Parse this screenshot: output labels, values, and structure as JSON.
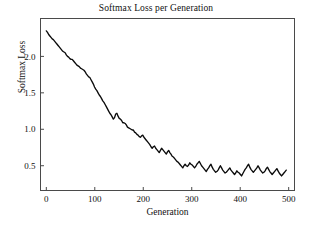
{
  "chart_data": {
    "type": "line",
    "title": "Softmax Loss per Generation",
    "xlabel": "Generation",
    "ylabel": "Softmax Loss",
    "xlim": [
      -12,
      512
    ],
    "ylim": [
      0.16,
      2.52
    ],
    "xticks": [
      0,
      100,
      200,
      300,
      400,
      500
    ],
    "xticklabels": [
      "0",
      "100",
      "200",
      "300",
      "400",
      "500"
    ],
    "yticks": [
      0.5,
      1.0,
      1.5,
      2.0
    ],
    "yticklabels": [
      "0.5",
      "1.0",
      "1.5",
      "2.0"
    ],
    "grid": false,
    "legend": null,
    "line_color": "#0b0b0b",
    "series": [
      {
        "name": "Softmax Loss",
        "x": [
          0,
          5,
          10,
          15,
          20,
          25,
          30,
          35,
          40,
          45,
          50,
          55,
          60,
          65,
          70,
          75,
          80,
          85,
          90,
          95,
          100,
          105,
          110,
          115,
          120,
          125,
          130,
          135,
          140,
          145,
          150,
          155,
          160,
          165,
          170,
          175,
          180,
          185,
          190,
          195,
          200,
          205,
          210,
          215,
          220,
          225,
          230,
          235,
          240,
          245,
          250,
          255,
          260,
          265,
          270,
          275,
          280,
          285,
          290,
          295,
          300,
          305,
          310,
          315,
          320,
          325,
          330,
          335,
          340,
          345,
          350,
          355,
          360,
          365,
          370,
          375,
          380,
          385,
          390,
          395,
          400,
          405,
          410,
          415,
          420,
          425,
          430,
          435,
          440,
          445,
          450,
          455,
          460,
          465,
          470,
          475,
          480,
          485,
          490,
          495
        ],
        "y": [
          2.35,
          2.3,
          2.24,
          2.21,
          2.17,
          2.12,
          2.08,
          2.06,
          2.0,
          1.97,
          1.96,
          1.9,
          1.86,
          1.83,
          1.81,
          1.74,
          1.71,
          1.64,
          1.58,
          1.53,
          1.47,
          1.41,
          1.37,
          1.31,
          1.25,
          1.2,
          1.14,
          1.17,
          1.22,
          1.14,
          1.09,
          1.08,
          1.03,
          1.0,
          0.99,
          0.95,
          0.92,
          0.89,
          0.92,
          0.87,
          0.83,
          0.79,
          0.74,
          0.77,
          0.72,
          0.68,
          0.74,
          0.7,
          0.66,
          0.71,
          0.66,
          0.62,
          0.58,
          0.55,
          0.51,
          0.47,
          0.52,
          0.49,
          0.54,
          0.51,
          0.47,
          0.52,
          0.56,
          0.5,
          0.46,
          0.42,
          0.47,
          0.52,
          0.45,
          0.41,
          0.44,
          0.5,
          0.44,
          0.4,
          0.43,
          0.47,
          0.42,
          0.38,
          0.43,
          0.4,
          0.36,
          0.42,
          0.47,
          0.52,
          0.45,
          0.41,
          0.45,
          0.5,
          0.44,
          0.4,
          0.43,
          0.48,
          0.42,
          0.38,
          0.42,
          0.46,
          0.4,
          0.36,
          0.4,
          0.44
        ],
        "y_detail": [
          2.35,
          2.33,
          2.3,
          2.28,
          2.26,
          2.24,
          2.23,
          2.21,
          2.19,
          2.17,
          2.15,
          2.13,
          2.11,
          2.09,
          2.07,
          2.06,
          2.05,
          2.02,
          2.0,
          1.99,
          1.97,
          1.96,
          1.96,
          1.94,
          1.92,
          1.9,
          1.88,
          1.87,
          1.86,
          1.84,
          1.83,
          1.82,
          1.81,
          1.79,
          1.76,
          1.74,
          1.72,
          1.71,
          1.68,
          1.65,
          1.62,
          1.58,
          1.55,
          1.53,
          1.5,
          1.47,
          1.45,
          1.42,
          1.39,
          1.37,
          1.34,
          1.31,
          1.28,
          1.25,
          1.22,
          1.2,
          1.17,
          1.14,
          1.16,
          1.21,
          1.22,
          1.18,
          1.15,
          1.14,
          1.12,
          1.09,
          1.09,
          1.08,
          1.06,
          1.03,
          1.02,
          1.01,
          1.0,
          0.99,
          0.99,
          0.96,
          0.95,
          0.93,
          0.92,
          0.9,
          0.89,
          0.91,
          0.92,
          0.89,
          0.87,
          0.85,
          0.83,
          0.81,
          0.79,
          0.76,
          0.74,
          0.76,
          0.77,
          0.74,
          0.72,
          0.7,
          0.68,
          0.71,
          0.74,
          0.72,
          0.7,
          0.68,
          0.66,
          0.69,
          0.71,
          0.68,
          0.66,
          0.63,
          0.62,
          0.6,
          0.58,
          0.56,
          0.55,
          0.53,
          0.51,
          0.49,
          0.47,
          0.5,
          0.52,
          0.5,
          0.49,
          0.51,
          0.54,
          0.52,
          0.51,
          0.49,
          0.47,
          0.49,
          0.52,
          0.54,
          0.56,
          0.53,
          0.5,
          0.48,
          0.46,
          0.44,
          0.42,
          0.45,
          0.47,
          0.5,
          0.52,
          0.48,
          0.45,
          0.43,
          0.41,
          0.42,
          0.44,
          0.47,
          0.5,
          0.47,
          0.44,
          0.42,
          0.4,
          0.41,
          0.43,
          0.45,
          0.47,
          0.44,
          0.42,
          0.4,
          0.38,
          0.4,
          0.43,
          0.41,
          0.4,
          0.38,
          0.36,
          0.39,
          0.42,
          0.45,
          0.47,
          0.5,
          0.52,
          0.48,
          0.45,
          0.43,
          0.41,
          0.43,
          0.45,
          0.47,
          0.5,
          0.47,
          0.44,
          0.42,
          0.4,
          0.41,
          0.43,
          0.46,
          0.48,
          0.45,
          0.42,
          0.4,
          0.38,
          0.4,
          0.42,
          0.44,
          0.46,
          0.43,
          0.4,
          0.38,
          0.36,
          0.38,
          0.4,
          0.42,
          0.44
        ]
      }
    ]
  }
}
